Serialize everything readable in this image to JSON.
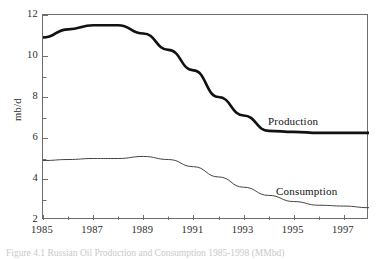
{
  "figure": {
    "caption": "Figure 4.1   Russian Oil Production and Consumption 1985-1998 (MMbd)"
  },
  "axes": {
    "y_title": "mb/d",
    "y_ticks": [
      "12",
      "10",
      "8",
      "6",
      "4",
      "2"
    ],
    "x_ticks": [
      "1985",
      "1987",
      "1989",
      "1991",
      "1993",
      "1995",
      "1997"
    ]
  },
  "labels": {
    "production": "Production",
    "consumption": "Consumption"
  },
  "chart_data": {
    "type": "line",
    "title": "Russian Oil Production and Consumption 1985-1998",
    "xlabel": "",
    "ylabel": "mb/d",
    "xlim": [
      1985,
      1998
    ],
    "ylim": [
      2,
      12
    ],
    "grid": false,
    "legend": "inline-labels",
    "x": [
      1985,
      1986,
      1987,
      1988,
      1989,
      1990,
      1991,
      1992,
      1993,
      1994,
      1995,
      1996,
      1997,
      1998
    ],
    "x_major_ticks": [
      1985,
      1987,
      1989,
      1991,
      1993,
      1995,
      1997
    ],
    "x_minor_ticks": [
      1986,
      1988,
      1990,
      1992,
      1994,
      1996,
      1998
    ],
    "y_major_ticks": [
      2,
      4,
      6,
      8,
      10,
      12
    ],
    "series": [
      {
        "name": "Production",
        "color": "#111111",
        "width": 2.6,
        "values": [
          10.9,
          11.3,
          11.5,
          11.5,
          11.1,
          10.3,
          9.3,
          8.0,
          7.1,
          6.35,
          6.3,
          6.25,
          6.25,
          6.25
        ]
      },
      {
        "name": "Consumption",
        "color": "#444444",
        "width": 1.0,
        "values": [
          4.9,
          4.95,
          5.0,
          5.0,
          5.1,
          4.95,
          4.6,
          4.1,
          3.6,
          3.2,
          2.9,
          2.72,
          2.68,
          2.6
        ]
      }
    ]
  }
}
